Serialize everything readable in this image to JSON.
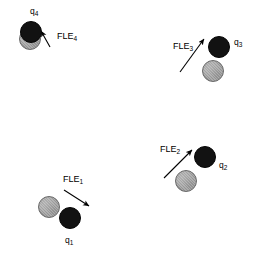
{
  "figure": {
    "background_color": "#ffffff",
    "black_node_color": "#121212",
    "gray_node_color": "#a3a3a3",
    "arrow_color": "#000000",
    "width": 257,
    "height": 256
  },
  "groups": [
    {
      "id": "group-4",
      "charge_label": "q",
      "charge_sub": "4",
      "force_label": "FLE",
      "force_sub": "4",
      "black_node": {
        "x": 20,
        "y": 21,
        "d": 22
      },
      "gray_node": {
        "x": 19,
        "y": 28,
        "d": 22
      },
      "arrow": {
        "x1": 50,
        "y1": 47,
        "x2": 41,
        "y2": 31
      },
      "charge_text_pos": {
        "x": 30,
        "y": 6
      },
      "force_text_pos": {
        "x": 57,
        "y": 31
      }
    },
    {
      "id": "group-3",
      "charge_label": "q",
      "charge_sub": "3",
      "force_label": "FLE",
      "force_sub": "3",
      "black_node": {
        "x": 208,
        "y": 36,
        "d": 22
      },
      "gray_node": {
        "x": 202,
        "y": 60,
        "d": 22
      },
      "arrow": {
        "x1": 180,
        "y1": 72,
        "x2": 204,
        "y2": 39
      },
      "charge_text_pos": {
        "x": 234,
        "y": 37
      },
      "force_text_pos": {
        "x": 173,
        "y": 41
      }
    },
    {
      "id": "group-2",
      "charge_label": "q",
      "charge_sub": "2",
      "force_label": "FLE",
      "force_sub": "2",
      "black_node": {
        "x": 194,
        "y": 146,
        "d": 22
      },
      "gray_node": {
        "x": 175,
        "y": 170,
        "d": 22
      },
      "arrow": {
        "x1": 164,
        "y1": 178,
        "x2": 192,
        "y2": 150
      },
      "charge_text_pos": {
        "x": 219,
        "y": 160
      },
      "force_text_pos": {
        "x": 160,
        "y": 144
      }
    },
    {
      "id": "group-1",
      "charge_label": "q",
      "charge_sub": "1",
      "force_label": "FLE",
      "force_sub": "1",
      "black_node": {
        "x": 59,
        "y": 207,
        "d": 22
      },
      "gray_node": {
        "x": 38,
        "y": 196,
        "d": 22
      },
      "arrow": {
        "x1": 64,
        "y1": 190,
        "x2": 89,
        "y2": 206
      },
      "charge_text_pos": {
        "x": 65,
        "y": 235
      },
      "force_text_pos": {
        "x": 63,
        "y": 174
      }
    }
  ]
}
